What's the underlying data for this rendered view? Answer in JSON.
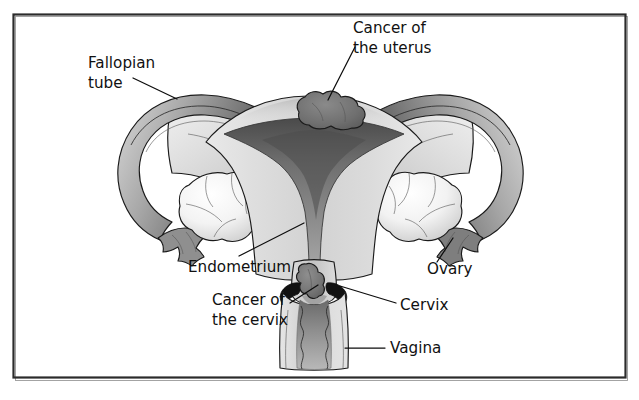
{
  "figure": {
    "background_color": "#ffffff",
    "frame_color": "#2b2b2b",
    "label_text_color": "#111111",
    "leader_line_color": "#0d0d0d"
  },
  "labels": [
    {
      "id": "fallopian-tube",
      "lines": [
        "Fallopian",
        "tube"
      ],
      "x": 88,
      "y": 68,
      "line_height": 20
    },
    {
      "id": "cancer-of-the-uterus",
      "lines": [
        "Cancer of",
        "the uterus"
      ],
      "x": 353,
      "y": 33,
      "line_height": 20
    },
    {
      "id": "endometrium",
      "lines": [
        "Endometrium"
      ],
      "x": 188,
      "y": 272,
      "line_height": 20
    },
    {
      "id": "cancer-of-the-cervix",
      "lines": [
        "Cancer of",
        "the cervix"
      ],
      "x": 212,
      "y": 305,
      "line_height": 20
    },
    {
      "id": "ovary",
      "lines": [
        "Ovary"
      ],
      "x": 427,
      "y": 274,
      "line_height": 20
    },
    {
      "id": "cervix",
      "lines": [
        "Cervix"
      ],
      "x": 400,
      "y": 310,
      "line_height": 20
    },
    {
      "id": "vagina",
      "lines": [
        "Vagina"
      ],
      "x": 390,
      "y": 353,
      "line_height": 20
    }
  ],
  "anatomy_parts": [
    {
      "id": "fallopian-tube-left",
      "name": "Left fallopian tube",
      "tone": "#8d8d8d"
    },
    {
      "id": "fallopian-tube-right",
      "name": "Right fallopian tube",
      "tone": "#8d8d8d"
    },
    {
      "id": "broad-ligament-left",
      "name": "Left broad ligament",
      "tone": "#d6d6d6"
    },
    {
      "id": "broad-ligament-right",
      "name": "Right broad ligament",
      "tone": "#d6d6d6"
    },
    {
      "id": "ovary-left",
      "name": "Left ovary",
      "tone": "#f2f2f2"
    },
    {
      "id": "ovary-right",
      "name": "Right ovary",
      "tone": "#f2f2f2"
    },
    {
      "id": "fimbriae-left",
      "name": "Left fimbriae",
      "tone": "#8a8a8a"
    },
    {
      "id": "fimbriae-right",
      "name": "Right fimbriae",
      "tone": "#8a8a8a"
    },
    {
      "id": "uterus-body",
      "name": "Uterus body",
      "tone": "#cfcfcf"
    },
    {
      "id": "endometrial-cavity",
      "name": "Endometrial cavity",
      "tone": "#6e6e6e"
    },
    {
      "id": "uterine-tumor",
      "name": "Cancer of the uterus tumour mass",
      "tone": "#6b6b6b"
    },
    {
      "id": "cervix-structure",
      "name": "Cervix",
      "tone": "#b9b9b9"
    },
    {
      "id": "cervical-tumor",
      "name": "Cancer of the cervix tumour mass",
      "tone": "#737373"
    },
    {
      "id": "vaginal-canal",
      "name": "Vagina",
      "tone": "#cacaca"
    }
  ],
  "palette": {
    "tissue_light": "#e2e2e2",
    "tissue_mid": "#c6c6c6",
    "tissue_dark": "#8b8b8b",
    "cavity_dark": "#5f5f5f",
    "tumor_gray": "#6e6e6e",
    "ovary_white": "#f4f4f4",
    "outline": "#1a1a1a"
  }
}
